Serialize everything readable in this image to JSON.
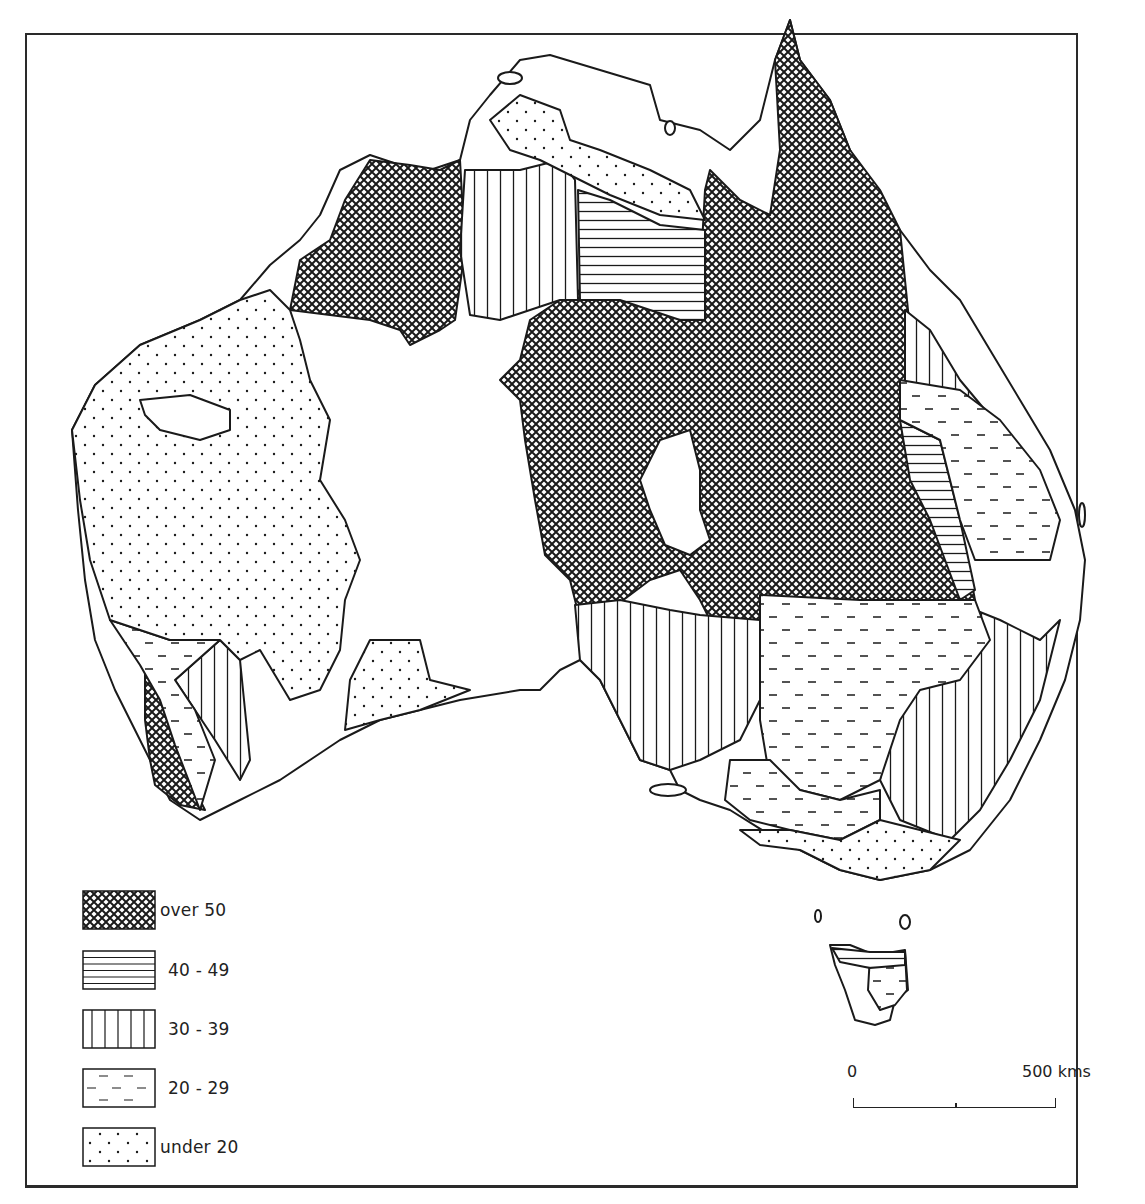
{
  "map": {
    "subject": "Australia",
    "style": "monochrome choropleth, pattern-filled classes",
    "colors": {
      "ink": "#1a1a1a",
      "paper": "#ffffff"
    }
  },
  "legend": {
    "items": [
      {
        "label": "over 50",
        "pattern": "crosshatch"
      },
      {
        "label": "40 - 49",
        "pattern": "horizontal-lines"
      },
      {
        "label": "30 - 39",
        "pattern": "vertical-lines"
      },
      {
        "label": "20 - 29",
        "pattern": "dashes"
      },
      {
        "label": "under 20",
        "pattern": "dots"
      }
    ]
  },
  "scale": {
    "start_label": "0",
    "end_label": "500 kms"
  }
}
